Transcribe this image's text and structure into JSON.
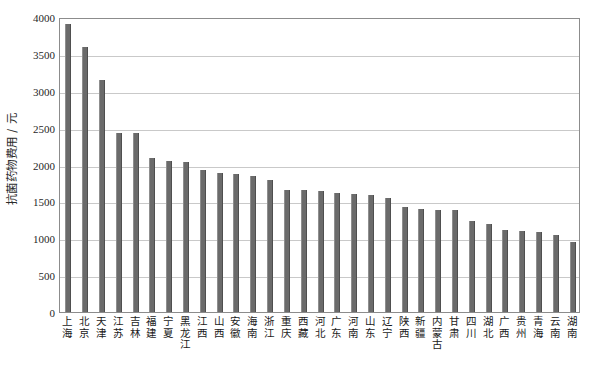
{
  "chart_data": {
    "type": "bar",
    "title": "",
    "subtitle": "",
    "xlabel": "",
    "ylabel": "抗菌药物费用 / 元",
    "ylim": [
      0,
      4000
    ],
    "ytick_values": [
      0,
      500,
      1000,
      1500,
      2000,
      2500,
      3000,
      3500,
      4000
    ],
    "ytick_labels": [
      "0",
      "500",
      "1000",
      "1500",
      "2000",
      "2500",
      "3000",
      "3500",
      "4000"
    ],
    "grid": true,
    "legend": null,
    "bar_color": "#6b6b6b",
    "categories": [
      "上海",
      "北京",
      "天津",
      "江苏",
      "吉林",
      "福建",
      "宁夏",
      "黑龙江",
      "江西",
      "山西",
      "安徽",
      "海南",
      "浙江",
      "重庆",
      "西藏",
      "河北",
      "广东",
      "河南",
      "山东",
      "辽宁",
      "陕西",
      "新疆",
      "内蒙古",
      "甘肃",
      "四川",
      "湖北",
      "广西",
      "贵州",
      "青海",
      "云南",
      "湖南"
    ],
    "values": [
      3900,
      3590,
      3150,
      2430,
      2430,
      2090,
      2050,
      2040,
      1920,
      1880,
      1870,
      1850,
      1790,
      1660,
      1650,
      1640,
      1610,
      1600,
      1590,
      1540,
      1430,
      1400,
      1390,
      1380,
      1230,
      1200,
      1110,
      1100,
      1080,
      1040,
      950
    ],
    "series": [
      {
        "name": "抗菌药物费用",
        "values": [
          3900,
          3590,
          3150,
          2430,
          2430,
          2090,
          2050,
          2040,
          1920,
          1880,
          1870,
          1850,
          1790,
          1660,
          1650,
          1640,
          1610,
          1600,
          1590,
          1540,
          1430,
          1400,
          1390,
          1380,
          1230,
          1200,
          1110,
          1100,
          1080,
          1040,
          950
        ]
      }
    ]
  }
}
